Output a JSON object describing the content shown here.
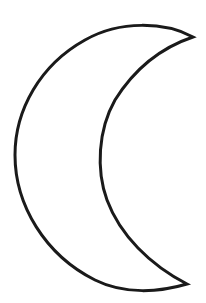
{
  "figure": {
    "style": "line-art outline",
    "colors": {
      "background": "#ffffff",
      "stroke": "#1a1a1a",
      "fill": "#ffffff"
    },
    "stroke_width": 3
  }
}
